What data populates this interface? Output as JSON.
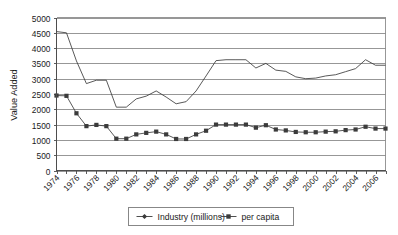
{
  "chart_data": {
    "type": "line",
    "title": "",
    "xlabel": "",
    "ylabel": "Value Added",
    "ylim": [
      0,
      5000
    ],
    "ytick_step": 500,
    "yticks": [
      "0",
      "500",
      "1000",
      "1500",
      "2000",
      "2500",
      "3000",
      "3500",
      "4000",
      "4500",
      "5000"
    ],
    "grid": true,
    "legend_position": "bottom",
    "x": [
      1974,
      1975,
      1976,
      1977,
      1978,
      1979,
      1980,
      1981,
      1982,
      1983,
      1984,
      1985,
      1986,
      1987,
      1988,
      1989,
      1990,
      1991,
      1992,
      1993,
      1994,
      1995,
      1996,
      1997,
      1998,
      1999,
      2000,
      2001,
      2002,
      2003,
      2004,
      2005,
      2006,
      2007
    ],
    "xtick_labels": [
      "1974",
      "1976",
      "1978",
      "1980",
      "1982",
      "1984",
      "1986",
      "1988",
      "1990",
      "1992",
      "1994",
      "1996",
      "1998",
      "2000",
      "2002",
      "2004",
      "2006"
    ],
    "series": [
      {
        "name": "Industry (millions)",
        "marker": "diamond",
        "color": "#3b3b3b",
        "values": [
          4540,
          4500,
          3580,
          2840,
          2950,
          2950,
          2070,
          2070,
          2340,
          2430,
          2600,
          2400,
          2180,
          2250,
          2600,
          3090,
          3590,
          3620,
          3620,
          3620,
          3350,
          3500,
          3280,
          3240,
          3060,
          3000,
          3020,
          3090,
          3130,
          3230,
          3330,
          3620,
          3440,
          3440
        ]
      },
      {
        "name": "per capita",
        "marker": "square",
        "color": "#3b3b3b",
        "values": [
          2450,
          2440,
          1870,
          1450,
          1490,
          1450,
          1040,
          1040,
          1180,
          1230,
          1270,
          1180,
          1030,
          1030,
          1180,
          1300,
          1500,
          1500,
          1500,
          1500,
          1400,
          1480,
          1340,
          1310,
          1260,
          1250,
          1250,
          1270,
          1280,
          1320,
          1340,
          1430,
          1370,
          1370
        ]
      }
    ]
  },
  "legend": {
    "items": [
      {
        "label": "Industry (millions)",
        "marker": "diamond"
      },
      {
        "label": "per capita",
        "marker": "square"
      }
    ]
  }
}
